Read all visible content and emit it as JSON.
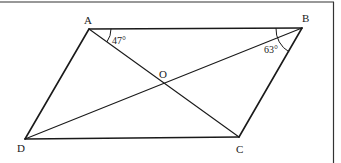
{
  "figure": {
    "type": "parallelogram-with-diagonals",
    "vertices": {
      "A": {
        "label": "A",
        "x": 89,
        "y": 29
      },
      "B": {
        "label": "B",
        "x": 302,
        "y": 28
      },
      "C": {
        "label": "C",
        "x": 239,
        "y": 137
      },
      "D": {
        "label": "D",
        "x": 25,
        "y": 139
      }
    },
    "intersection": {
      "label": "O",
      "x": 163,
      "y": 82
    },
    "sides": [
      "AB",
      "BC",
      "CD",
      "DA"
    ],
    "diagonals": [
      "AC",
      "BD"
    ],
    "angles": [
      {
        "at": "A",
        "between": "BAC",
        "label": "47°"
      },
      {
        "at": "B",
        "between": "ABD",
        "label": "63°"
      }
    ],
    "colors": {
      "stroke": "#1a1a1a",
      "frame": "#333333",
      "background": "#ffffff"
    }
  }
}
